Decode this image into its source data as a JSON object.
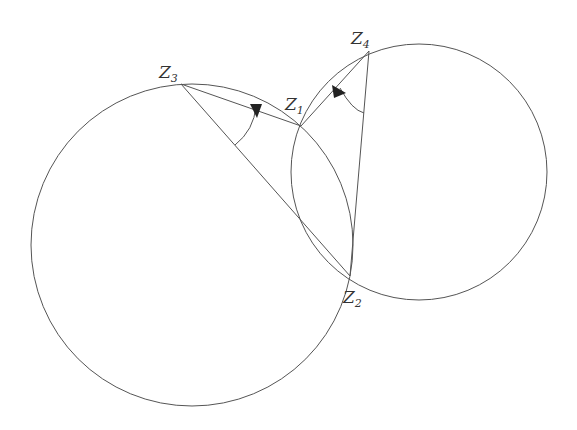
{
  "diagram": {
    "stroke_color": "#555555",
    "label_color": "#333333",
    "circles": [
      {
        "name": "left-circle",
        "cx": 192,
        "cy": 245,
        "r": 161
      },
      {
        "name": "right-circle",
        "cx": 419,
        "cy": 172,
        "r": 128
      }
    ],
    "points": {
      "z1": {
        "x": 301,
        "y": 126,
        "label": "Z",
        "sub": "1"
      },
      "z2": {
        "x": 350,
        "y": 276,
        "label": "Z",
        "sub": "2"
      },
      "z3": {
        "x": 181,
        "y": 84,
        "label": "Z",
        "sub": "3"
      },
      "z4": {
        "x": 369,
        "y": 51,
        "label": "Z",
        "sub": "4"
      }
    },
    "segments": [
      [
        "z3",
        "z1"
      ],
      [
        "z3",
        "z2"
      ],
      [
        "z1",
        "z4"
      ],
      [
        "z4",
        "z2"
      ]
    ],
    "angle_arcs": [
      {
        "vertex": "z3",
        "between": [
          "z2",
          "z1"
        ]
      },
      {
        "vertex": "z4",
        "between": [
          "z1",
          "z2"
        ]
      }
    ]
  }
}
